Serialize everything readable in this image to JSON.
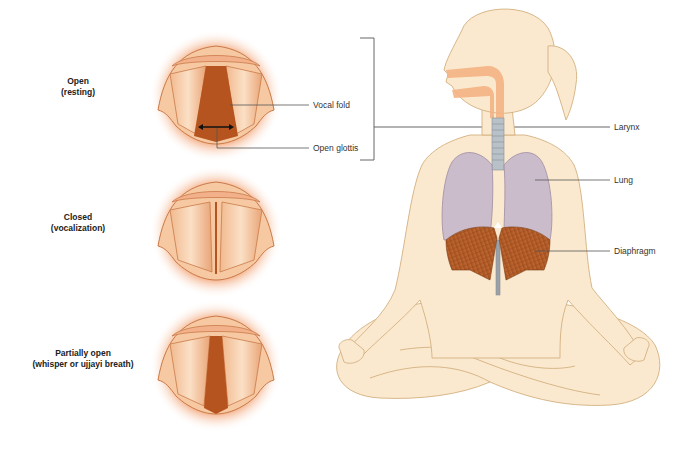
{
  "states": [
    {
      "title": "Open",
      "subtitle": "(resting)"
    },
    {
      "title": "Closed",
      "subtitle": "(vocalization)"
    },
    {
      "title": "Partially open",
      "subtitle": "(whisper or ujjayi breath)"
    }
  ],
  "callouts": {
    "vocal_fold": "Vocal fold",
    "open_glottis": "Open glottis",
    "larynx": "Larynx",
    "lung": "Lung",
    "diaphragm": "Diaphragm"
  },
  "colors": {
    "skin": "#fbe9cf",
    "skin_outline": "#d9b98a",
    "airway": "#f4b383",
    "lung": "#c9b8c8",
    "diaphragm": "#b8602a",
    "glottis": "#b5541e",
    "fold_glow": "#f0a074",
    "leader_line": "#555555"
  }
}
